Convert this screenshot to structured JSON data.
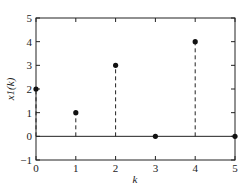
{
  "chart_data": {
    "type": "stem",
    "title": "",
    "xlabel": "k",
    "ylabel": "x1(k)",
    "xlim": [
      0,
      5
    ],
    "ylim": [
      -1,
      5
    ],
    "xticks": [
      0,
      1,
      2,
      3,
      4,
      5
    ],
    "yticks": [
      -1,
      0,
      1,
      2,
      3,
      4,
      5
    ],
    "grid": false,
    "legend": null,
    "x": [
      0,
      1,
      2,
      3,
      4,
      5
    ],
    "values": [
      2,
      1,
      3,
      0,
      4,
      0
    ],
    "baseline": 0,
    "stem_style": "dashed",
    "marker": "filled-circle",
    "colors": {
      "line": "#222222",
      "marker": "#111111"
    }
  }
}
